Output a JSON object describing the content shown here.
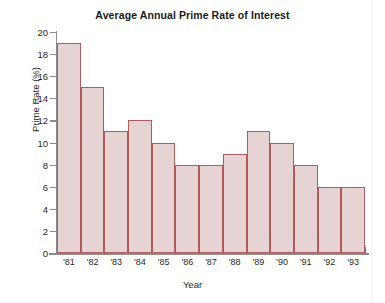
{
  "chart_data": {
    "type": "bar",
    "title": "Average Annual Prime Rate of Interest",
    "xlabel": "Year",
    "ylabel": "Prime Rate (%)",
    "categories": [
      "'81",
      "'82",
      "'83",
      "'84",
      "'85",
      "'86",
      "'87",
      "'88",
      "'89",
      "'90",
      "'91",
      "'92",
      "'93"
    ],
    "values": [
      19,
      15,
      11,
      12,
      10,
      8,
      8,
      9,
      11,
      10,
      8,
      6,
      6
    ],
    "ylim": [
      0,
      20
    ],
    "ytick_step": 2,
    "ytick_labels": [
      "0",
      "2",
      "4",
      "6",
      "8",
      "10",
      "12",
      "14",
      "16",
      "18",
      "20"
    ],
    "xtick_labels": [
      "'81",
      "'82",
      "'83",
      "'84",
      "'85",
      "'86",
      "'87",
      "'88",
      "'89",
      "'90",
      "'91",
      "'92",
      "'93"
    ],
    "grid": false,
    "legend": null,
    "colors": {
      "bar_fill": "#e6d3d3",
      "bar_border": "#b4595c",
      "axis": "#8c8c8c",
      "text": "#1f1f1f",
      "background": "#ffffff"
    }
  }
}
